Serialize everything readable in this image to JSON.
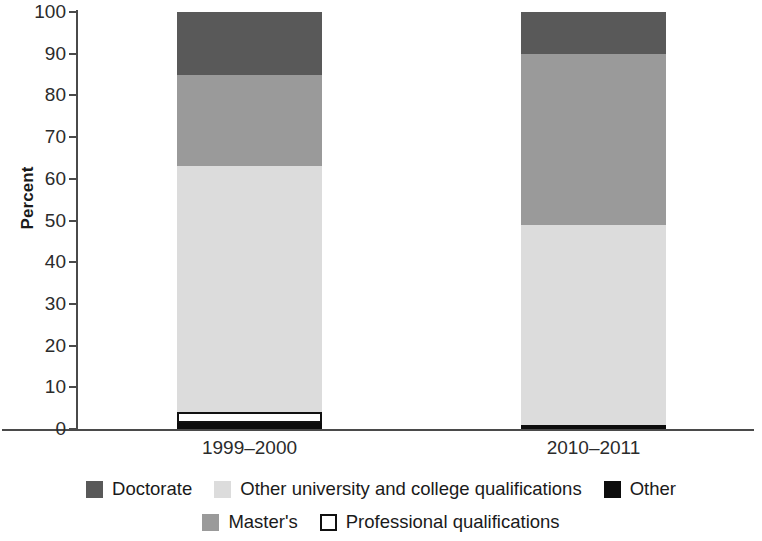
{
  "chart_data": {
    "type": "bar",
    "subtype": "stacked-bar-100-percent",
    "title": "",
    "subtitle": "",
    "xlabel": "",
    "ylabel": "Percent",
    "categories": [
      "1999–2000",
      "2010–2011"
    ],
    "ylim": [
      0,
      100
    ],
    "yticks": [
      0,
      10,
      20,
      30,
      40,
      50,
      60,
      70,
      80,
      90,
      100
    ],
    "ytick_labels": [
      "0",
      "10",
      "20",
      "30",
      "40",
      "50",
      "60",
      "70",
      "80",
      "90",
      "100"
    ],
    "grid": false,
    "legend_position": "bottom",
    "stack_order_bottom_to_top": [
      "Other",
      "Professional qualifications",
      "Other university and college qualifications",
      "Master's",
      "Doctorate"
    ],
    "series": [
      {
        "name": "Doctorate",
        "color": "#595959",
        "values": [
          15,
          10
        ]
      },
      {
        "name": "Master's",
        "color": "#9a9a9a",
        "values": [
          22,
          41
        ]
      },
      {
        "name": "Other university and college qualifications",
        "color": "#dcdcdc",
        "values": [
          59,
          48
        ]
      },
      {
        "name": "Professional qualifications",
        "color": "#ffffff",
        "values": [
          2.5,
          0
        ]
      },
      {
        "name": "Other",
        "color": "#0d0d0d",
        "values": [
          1.5,
          1
        ]
      }
    ],
    "legend_entries": [
      {
        "label": "Doctorate",
        "color": "#595959",
        "swatch": "filled"
      },
      {
        "label": "Other university and college qualifications",
        "color": "#dcdcdc",
        "swatch": "filled"
      },
      {
        "label": "Other",
        "color": "#0d0d0d",
        "swatch": "filled"
      },
      {
        "label": "Master's",
        "color": "#9a9a9a",
        "swatch": "filled"
      },
      {
        "label": "Professional qualifications",
        "color": "#ffffff",
        "swatch": "outlined"
      }
    ]
  },
  "geometry": {
    "plot_left_px": 78,
    "plot_right_px": 754,
    "plot_top_px": 12,
    "plot_bottom_px": 429,
    "bar_width_px": 145,
    "bar_centers_px": [
      249.5,
      593.5
    ]
  }
}
